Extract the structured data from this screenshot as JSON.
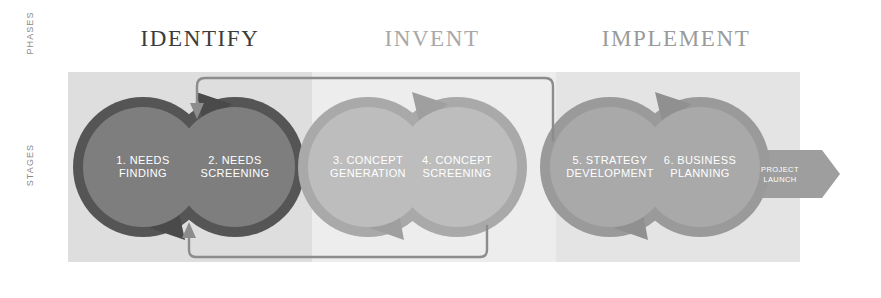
{
  "axis": {
    "phases": "PHASES",
    "stages": "STAGES"
  },
  "phases": [
    {
      "name": "identify",
      "label": "IDENTIFY",
      "color": "#3c3c3c",
      "band_color": "#dedede"
    },
    {
      "name": "invent",
      "label": "INVENT",
      "color": "#a8a8a8",
      "band_color": "#ededed"
    },
    {
      "name": "implement",
      "label": "IMPLEMENT",
      "color": "#9a9a9a",
      "band_color": "#e4e4e4"
    }
  ],
  "stages": [
    {
      "number": "1.",
      "line1": "1. NEEDS",
      "line2": "FINDING",
      "cx": 143,
      "cy": 167,
      "r": 60,
      "fill": "#7e7e7e",
      "ring": "#5e5e5e"
    },
    {
      "number": "2.",
      "line1": "2. NEEDS",
      "line2": "SCREENING",
      "cx": 235,
      "cy": 167,
      "r": 60,
      "fill": "#7e7e7e",
      "ring": "#5e5e5e"
    },
    {
      "number": "3.",
      "line1": "3. CONCEPT",
      "line2": "GENERATION",
      "cx": 368,
      "cy": 167,
      "r": 60,
      "fill": "#bdbdbd",
      "ring": "#a6a6a6"
    },
    {
      "number": "4.",
      "line1": "4. CONCEPT",
      "line2": "SCREENING",
      "cx": 457,
      "cy": 167,
      "r": 60,
      "fill": "#bdbdbd",
      "ring": "#a6a6a6"
    },
    {
      "number": "5.",
      "line1": "5. STRATEGY",
      "line2": "DEVELOPMENT",
      "cx": 610,
      "cy": 167,
      "r": 60,
      "fill": "#a9a9a9",
      "ring": "#949494"
    },
    {
      "number": "6.",
      "line1": "6. BUSINESS",
      "line2": "PLANNING",
      "cx": 700,
      "cy": 167,
      "r": 60,
      "fill": "#a9a9a9",
      "ring": "#949494"
    }
  ],
  "launch": {
    "line1": "PROJECT",
    "line2": "LAUNCH",
    "fill": "#9e9e9e"
  },
  "feedback_arrows": [
    {
      "name": "top-feedback-arrow",
      "from_stage": 4,
      "to_stage": 1,
      "color": "#8c8c8c"
    },
    {
      "name": "bottom-feedback-arrow",
      "from_stage": 4,
      "to_stage": 2,
      "color": "#8c8c8c"
    }
  ],
  "colors": {
    "background": "#ffffff",
    "axis_text": "#8a8a8a",
    "node_text": "#ffffff"
  }
}
